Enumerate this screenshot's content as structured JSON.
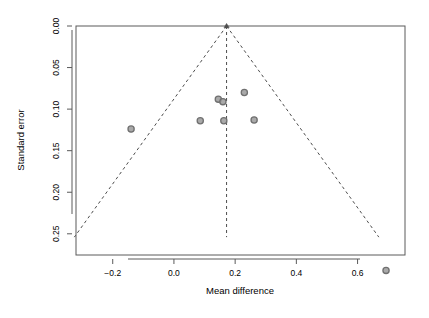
{
  "chart_data": {
    "type": "scatter",
    "title": "",
    "subtitle": "",
    "xlabel": "Mean difference",
    "ylabel": "Standard error",
    "xlim": [
      -0.32,
      0.755
    ],
    "ylim": [
      0.2755,
      0.0
    ],
    "y_inverted": true,
    "grid": false,
    "legend": "none",
    "xticks": [
      "-0.2",
      "0.0",
      "0.2",
      "0.4",
      "0.6"
    ],
    "xtick_values": [
      -0.2,
      0.0,
      0.2,
      0.4,
      0.6
    ],
    "yticks": [
      "0.00",
      "0.05",
      "0.10",
      "0.15",
      "0.20",
      "0.25"
    ],
    "ytick_values": [
      0.0,
      0.05,
      0.1,
      0.15,
      0.2,
      0.25
    ],
    "point_color": "#707070",
    "point_fill": "#9a9a9a",
    "line_color": "#4d4d4d",
    "axis_color": "#5a5a5a",
    "series": [
      {
        "name": "studies",
        "marker": "circle",
        "points": [
          {
            "x": -0.14,
            "y": 0.124
          },
          {
            "x": 0.086,
            "y": 0.114
          },
          {
            "x": 0.145,
            "y": 0.088
          },
          {
            "x": 0.16,
            "y": 0.091
          },
          {
            "x": 0.163,
            "y": 0.114
          },
          {
            "x": 0.23,
            "y": 0.08
          },
          {
            "x": 0.262,
            "y": 0.113
          },
          {
            "x": 0.693,
            "y": 0.294
          }
        ]
      }
    ],
    "reference_line": {
      "name": "pooled-effect",
      "x": 0.172,
      "style": "dashed"
    },
    "funnel_limits": {
      "name": "pseudo-95-confidence-limits",
      "style": "dashed",
      "apex": {
        "x": 0.172,
        "y": 0.0
      },
      "left_base": {
        "x": -0.3255,
        "y": 0.254
      },
      "right_base": {
        "x": 0.6695,
        "y": 0.254
      }
    },
    "apex_marker": {
      "x": 0.172,
      "y": 0.0,
      "marker": "triangle"
    }
  },
  "plot": {
    "xlabel": "Mean difference",
    "ylabel": "Standard error"
  }
}
